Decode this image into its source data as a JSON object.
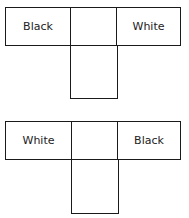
{
  "diagrams": [
    {
      "name": "top-t-shape",
      "left_label": "Black",
      "middle_label": "",
      "right_label": "White",
      "stem_label": ""
    },
    {
      "name": "bottom-t-shape",
      "left_label": "White",
      "middle_label": "",
      "right_label": "Black",
      "stem_label": ""
    }
  ],
  "colors": {
    "stroke": "#1a1a1a",
    "background": "#ffffff"
  }
}
